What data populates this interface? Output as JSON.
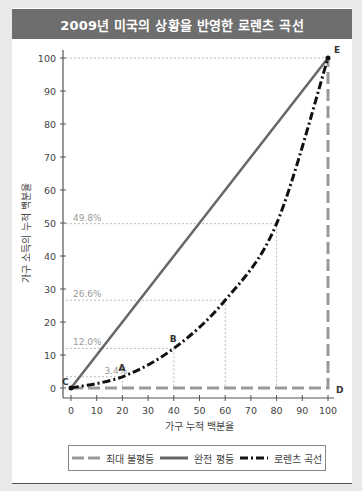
{
  "title": "2009년 미국의 상황을 반영한 로렌츠 곡선",
  "chart_data": {
    "type": "line",
    "title": "2009년 미국의 상황을 반영한 로렌츠 곡선",
    "xlabel": "가구 누적 백분율",
    "ylabel": "가구 소득의 누적 백분율",
    "xlim": [
      0,
      100
    ],
    "ylim": [
      0,
      100
    ],
    "x_ticks": [
      0,
      10,
      20,
      30,
      40,
      50,
      60,
      70,
      80,
      90,
      100
    ],
    "y_ticks": [
      0,
      10,
      20,
      30,
      40,
      50,
      60,
      70,
      80,
      90,
      100
    ],
    "grid": false,
    "legend_position": "bottom",
    "series": [
      {
        "name": "최대 불평등",
        "style": "gray-long-dash",
        "color": "#9a9a9a",
        "x": [
          0,
          100,
          100
        ],
        "y": [
          0,
          0,
          100
        ]
      },
      {
        "name": "완전 평등",
        "style": "solid",
        "color": "#666666",
        "x": [
          0,
          100
        ],
        "y": [
          0,
          100
        ]
      },
      {
        "name": "로렌츠 곡선",
        "style": "black-dash-dot",
        "color": "#111111",
        "x": [
          0,
          20,
          40,
          60,
          80,
          100
        ],
        "y": [
          0,
          3.4,
          12.0,
          26.6,
          49.8,
          100
        ]
      }
    ],
    "annotations": [
      {
        "text": "3.4%",
        "x": 20,
        "y": 3.4
      },
      {
        "text": "12.0%",
        "x": 40,
        "y": 12.0
      },
      {
        "text": "26.6%",
        "x": 60,
        "y": 26.6
      },
      {
        "text": "49.8%",
        "x": 80,
        "y": 49.8
      }
    ],
    "point_labels": [
      {
        "label": "A",
        "x": 20,
        "y": 3.4
      },
      {
        "label": "B",
        "x": 40,
        "y": 12.0
      },
      {
        "label": "C",
        "x": 0,
        "y": 0
      },
      {
        "label": "D",
        "x": 100,
        "y": 0
      },
      {
        "label": "E",
        "x": 100,
        "y": 100
      }
    ]
  },
  "legend": {
    "max_inequality": "최대 불평등",
    "perfect_equality": "완전 평등",
    "lorenz_curve": "로렌츠 곡선"
  }
}
